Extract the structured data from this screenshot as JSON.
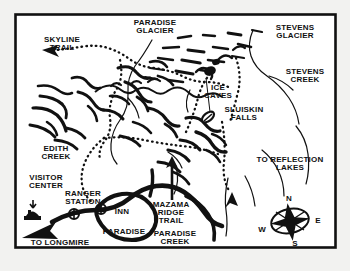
{
  "figure": {
    "kind": "hand-drawn-trail-map",
    "region": "Paradise Area, Mount Rainier",
    "background_color": "#f2f2f0",
    "paper_color": "#ffffff",
    "ink_color": "#111111",
    "border": {
      "visible": true,
      "style": "solid-black-rectangle"
    }
  },
  "labels": {
    "skyline_trail": "SKYLINE\nTRAIL",
    "paradise_glacier": "PARADISE\nGLACIER",
    "stevens_glacier": "STEVENS\nGLACIER",
    "stevens_creek": "STEVENS\nCREEK",
    "ice_caves": "ICE\nCAVES",
    "sluiskin_falls": "SLUISKIN\nFALLS",
    "edith_creek": "EDITH\nCREEK",
    "visitor_center": "VISITOR\nCENTER",
    "ranger_station": "RANGER\nSTATION",
    "inn": "INN",
    "paradise": "PARADISE",
    "paradise_creek": "PARADISE\nCREEK",
    "to_longmire": "TO LONGMIRE",
    "to_reflection_lakes": "TO REFLECTION\nLAKES",
    "mazama_ridge_trail": "MAZAMA\nRIDGE\nTRAIL"
  },
  "compass": {
    "north": "N",
    "east": "E",
    "south": "S",
    "west": "W"
  },
  "map_features": {
    "trails_dotted": [
      "skyline-trail",
      "mazama-ridge-trail",
      "reflection-lakes-spur"
    ],
    "roads_solid_thick": [
      "paradise-road-loop",
      "longmire-road"
    ],
    "water_thin_lines": [
      "edith-creek",
      "paradise-creek",
      "stevens-creek"
    ],
    "landmark_symbols": [
      "visitor-center-building",
      "ranger-station-building",
      "paradise-inn-building"
    ],
    "direction_arrows": [
      "arrow-to-skyline-trail",
      "arrow-to-longmire",
      "arrow-to-visitor-center",
      "arrow-to-reflection-lakes",
      "arrow-to-mazama-ridge"
    ]
  }
}
